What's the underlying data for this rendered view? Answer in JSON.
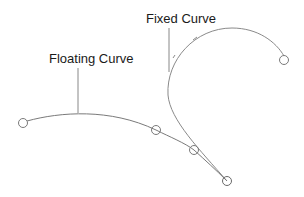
{
  "diagram": {
    "labels": {
      "floating_curve": "Floating Curve",
      "fixed_curve": "Fixed Curve"
    },
    "colors": {
      "curve": "#8a8a8a",
      "leader": "#888888",
      "handle": "#7a7a7a",
      "text": "#1a1a1a",
      "background": "#ffffff"
    },
    "floating_curve": {
      "control_points": [
        {
          "x": 23,
          "y": 123
        },
        {
          "x": 156,
          "y": 130
        },
        {
          "x": 194,
          "y": 150
        },
        {
          "x": 227,
          "y": 181
        }
      ]
    },
    "fixed_curve": {
      "endpoint": {
        "x": 284,
        "y": 60
      },
      "tangent_end": {
        "x": 227,
        "y": 181
      }
    }
  }
}
